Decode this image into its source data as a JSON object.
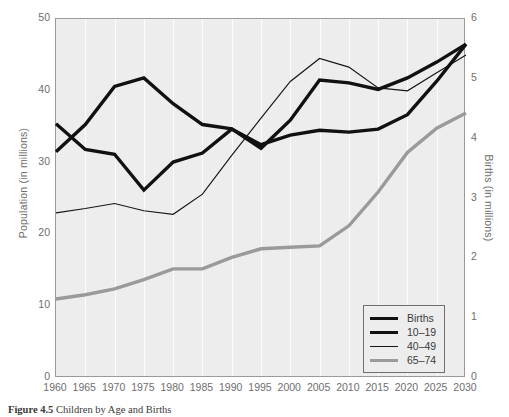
{
  "chart_data": {
    "type": "line",
    "title": "",
    "xlabel": "",
    "ylabel": "Population (in millions)",
    "y2label": "Births (in millions)",
    "x": [
      1960,
      1965,
      1970,
      1975,
      1980,
      1985,
      1990,
      1995,
      2000,
      2005,
      2010,
      2015,
      2020,
      2025,
      2030
    ],
    "xlim": [
      1960,
      2030
    ],
    "ylim": [
      0,
      50
    ],
    "y2lim": [
      0,
      6
    ],
    "xticks": [
      "1960",
      "1965",
      "1970",
      "1975",
      "1980",
      "1985",
      "1990",
      "1995",
      "2000",
      "2005",
      "2010",
      "2015",
      "2020",
      "2025",
      "2030"
    ],
    "yticks": [
      "0",
      "10",
      "20",
      "30",
      "40",
      "50"
    ],
    "y2ticks": [
      "0",
      "1",
      "2",
      "3",
      "4",
      "5",
      "6"
    ],
    "grid": "vertical-only",
    "legend_position": "bottom-right",
    "series": [
      {
        "name": "Births",
        "axis": "right",
        "units": "millions",
        "style": "thick-black",
        "color": "#111111",
        "values": [
          4.25,
          3.82,
          3.74,
          3.14,
          3.61,
          3.76,
          4.16,
          3.9,
          4.06,
          4.14,
          4.11,
          4.16,
          4.4,
          4.96,
          5.58
        ]
      },
      {
        "name": "10-19",
        "axis": "left",
        "units": "millions",
        "style": "thick-black",
        "color": "#111111",
        "values": [
          31.5,
          35.3,
          40.6,
          41.8,
          38.2,
          35.3,
          34.7,
          32.0,
          35.9,
          41.5,
          41.1,
          40.2,
          41.8,
          44.0,
          46.5
        ]
      },
      {
        "name": "40-49",
        "axis": "left",
        "units": "millions",
        "style": "thin-black",
        "color": "#161616",
        "values": [
          23.0,
          23.6,
          24.3,
          23.3,
          22.8,
          25.6,
          31.0,
          36.2,
          41.3,
          44.5,
          43.3,
          40.4,
          40.0,
          42.5,
          45.0
        ]
      },
      {
        "name": "65-74",
        "axis": "left",
        "units": "millions",
        "style": "thick-gray",
        "color": "#9a9a9a",
        "values": [
          11.0,
          11.6,
          12.4,
          13.7,
          15.2,
          15.2,
          16.8,
          18.0,
          18.2,
          18.4,
          21.2,
          25.9,
          31.4,
          34.8,
          36.9
        ]
      }
    ]
  },
  "axes": {
    "left_title": "Population (in millions)",
    "right_title": "Births (in millions)"
  },
  "legend": {
    "items": [
      {
        "label": "Births",
        "style": "thick"
      },
      {
        "label": "10–19",
        "style": "thick"
      },
      {
        "label": "40–49",
        "style": "thin"
      },
      {
        "label": "65–74",
        "style": "gray"
      }
    ]
  },
  "caption": {
    "figure_number": "Figure 4.5",
    "text": "Children by Age and Births"
  }
}
